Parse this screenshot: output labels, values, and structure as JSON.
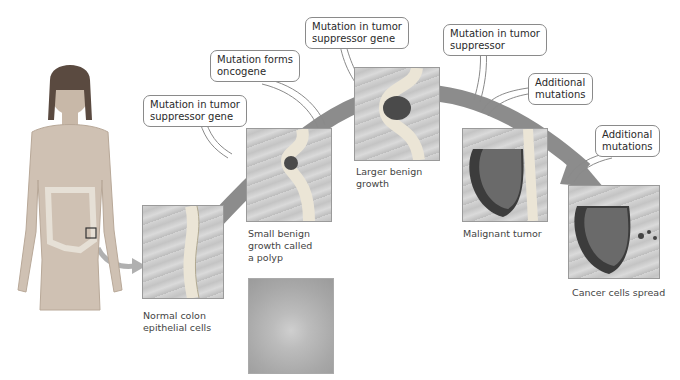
{
  "diagram": {
    "callouts": [
      {
        "id": "c1",
        "text_lines": [
          "Mutation in tumor",
          "suppressor gene"
        ]
      },
      {
        "id": "c2",
        "text_lines": [
          "Mutation forms",
          "oncogene"
        ]
      },
      {
        "id": "c3",
        "text_lines": [
          "Mutation in tumor",
          "suppressor gene"
        ]
      },
      {
        "id": "c4",
        "text_lines": [
          "Mutation in tumor",
          "suppressor"
        ]
      },
      {
        "id": "c5",
        "text_lines": [
          "Additional",
          "mutations"
        ]
      },
      {
        "id": "c6",
        "text_lines": [
          "Additional",
          "mutations"
        ]
      }
    ],
    "stages": [
      {
        "id": "normal",
        "caption_lines": [
          "Normal colon",
          "epithelial cells"
        ]
      },
      {
        "id": "polyp",
        "caption_lines": [
          "Small benign",
          "growth called",
          "a polyp"
        ]
      },
      {
        "id": "larger",
        "caption_lines": [
          "Larger benign",
          "growth"
        ]
      },
      {
        "id": "malignant",
        "caption_lines": [
          "Malignant tumor"
        ]
      },
      {
        "id": "spread",
        "caption_lines": [
          "Cancer cells spread"
        ]
      }
    ],
    "colors": {
      "arrow": "#8c8c8c",
      "callout_border": "#8a8a8a",
      "tissue_light": "#e8e3d6",
      "tumor_dark": "#4a4a4a",
      "cells": "#3a3a3a"
    }
  }
}
